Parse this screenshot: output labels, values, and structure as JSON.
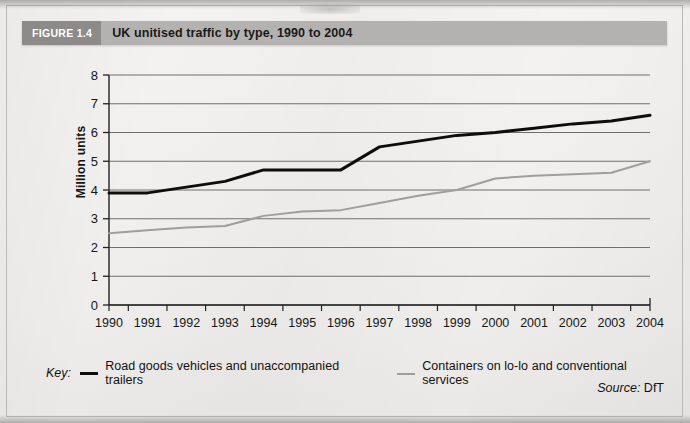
{
  "figure": {
    "tag": "FIGURE 1.4",
    "title": "UK unitised traffic by type, 1990 to 2004",
    "source_prefix": "Source:",
    "source_value": "DfT",
    "key_label": "Key:"
  },
  "chart_data": {
    "type": "line",
    "title": "UK unitised traffic by type, 1990 to 2004",
    "xlabel": "",
    "ylabel": "Million units",
    "categories": [
      "1990",
      "1991",
      "1992",
      "1993",
      "1994",
      "1995",
      "1996",
      "1997",
      "1998",
      "1999",
      "2000",
      "2001",
      "2002",
      "2003",
      "2004"
    ],
    "ylim": [
      0,
      8
    ],
    "ytick_labels": [
      "0",
      "1",
      "2",
      "3",
      "4",
      "5",
      "6",
      "7",
      "8"
    ],
    "grid": "horizontal",
    "legend_position": "bottom",
    "series": [
      {
        "name": "Road goods vehicles and unaccompanied trailers",
        "color": "#0d0d0d",
        "width": 3,
        "values": [
          3.9,
          3.9,
          4.1,
          4.3,
          4.7,
          4.7,
          4.7,
          5.5,
          5.7,
          5.9,
          6.0,
          6.15,
          6.3,
          6.4,
          6.6
        ]
      },
      {
        "name": "Containers on lo-lo and conventional services",
        "color": "#9e9e9e",
        "width": 2,
        "values": [
          2.5,
          2.6,
          2.7,
          2.75,
          3.1,
          3.25,
          3.3,
          3.55,
          3.8,
          4.0,
          4.4,
          4.5,
          4.55,
          4.6,
          5.0
        ]
      }
    ]
  },
  "colors": {
    "figure_tag_bg": "#8c8b89",
    "figure_title_bg": "#b3b2b0",
    "series_1": "#0d0d0d",
    "series_2": "#9e9e9e",
    "gridline": "#6f6f6f",
    "page": "#f1f0ee"
  }
}
